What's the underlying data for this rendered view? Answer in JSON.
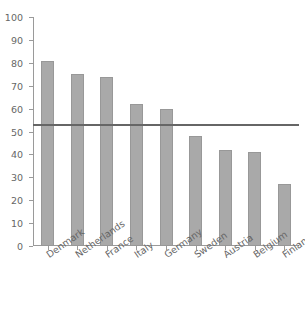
{
  "chart_data": {
    "type": "bar",
    "title": "",
    "xlabel": "",
    "ylabel": "",
    "ylim": [
      0,
      100
    ],
    "yticks": [
      0,
      10,
      20,
      30,
      40,
      50,
      60,
      70,
      80,
      90,
      100
    ],
    "grid": false,
    "legend": "none",
    "categories": [
      "Denmark",
      "Netherlands",
      "France",
      "Italy",
      "Germany",
      "Sweden",
      "Austria",
      "Belgium",
      "Finland"
    ],
    "values": [
      81,
      75,
      74,
      62,
      60,
      48,
      42,
      41,
      27
    ],
    "annotations": [
      {
        "type": "horizontal-reference-line",
        "value": 53,
        "color": "#666666"
      }
    ],
    "colors": {
      "bar_fill": "#a9a9a9",
      "bar_edge": "#989898",
      "axis": "#9a9a9a",
      "text": "#666666",
      "reference_line": "#666666",
      "background": "#ffffff"
    }
  }
}
